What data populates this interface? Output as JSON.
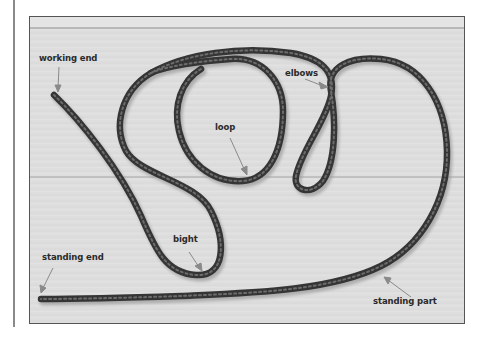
{
  "figure": {
    "labels": {
      "working_end": "working end",
      "loop": "loop",
      "elbows": "elbows",
      "bight": "bight",
      "standing_end": "standing end",
      "standing_part": "standing part"
    },
    "colors": {
      "rope": "#3a3a3a",
      "rope_pattern": "#6a6a6a",
      "board": "#dcdcdc",
      "arrow": "#8a8a8a",
      "label": "#2a2a2a",
      "frame": "#555555"
    }
  }
}
